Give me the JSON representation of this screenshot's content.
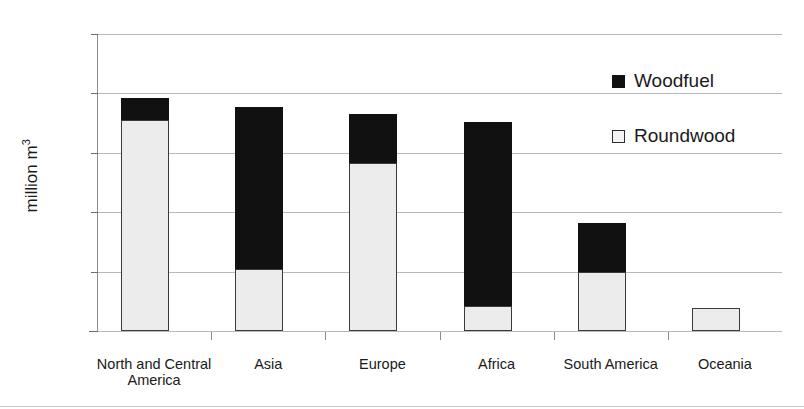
{
  "chart_data": {
    "type": "bar",
    "subtype": "stacked-vertical",
    "title": "",
    "xlabel": "",
    "ylabel": "million m3",
    "ylabel_display": "million m",
    "ylabel_superscript": "3",
    "ylim": [
      0,
      1000
    ],
    "yticks": [
      0,
      200,
      400,
      600,
      800,
      1000
    ],
    "ytick_labels": [
      "0",
      "200",
      "400",
      "600",
      "800",
      "1000"
    ],
    "grid": true,
    "grid_axis": "y",
    "legend_position": "inside-top-right",
    "categories": [
      "North and Central America",
      "Asia",
      "Europe",
      "Africa",
      "South America",
      "Oceania"
    ],
    "category_lines": [
      [
        "North and Central",
        "America"
      ],
      [
        "Asia"
      ],
      [
        "Europe"
      ],
      [
        "Africa"
      ],
      [
        "South America"
      ],
      [
        "Oceania"
      ]
    ],
    "series": [
      {
        "name": "Roundwood",
        "color": "#ececec",
        "border_color": "#3a3a3a",
        "values": [
          710,
          210,
          565,
          85,
          200,
          78
        ]
      },
      {
        "name": "Woodfuel",
        "color": "#111111",
        "border_color": "#111111",
        "values": [
          75,
          545,
          165,
          620,
          165,
          0
        ]
      }
    ],
    "totals": [
      785,
      755,
      730,
      705,
      365,
      78
    ],
    "legend": [
      {
        "label": "Woodfuel",
        "swatch": "filled-black-square"
      },
      {
        "label": "Roundwood",
        "swatch": "outlined-white-square"
      }
    ]
  },
  "colors": {
    "woodfuel": "#111111",
    "roundwood": "#ececec",
    "gridline": "#b9b9b9",
    "axis": "#6d6d6d",
    "text": "#1a1a1a",
    "background": "#ffffff"
  }
}
